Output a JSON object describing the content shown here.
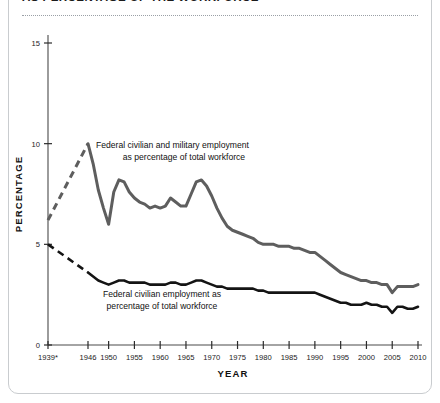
{
  "header": {
    "title": "AS PERCENTAGE OF THE WORKFORCE",
    "divider": "dotted-rule"
  },
  "colors": {
    "federal_total": "#5e5e5e",
    "federal_civilian": "#141414",
    "axis": "#4a4a4a",
    "text": "#111111",
    "card_border": "#c9cccf",
    "background": "#ffffff"
  },
  "annotations": {
    "total": {
      "line1": "Federal civilian and military employment",
      "line2": "as percentage of total workforce"
    },
    "civilian": {
      "line1": "Federal civilian employment as",
      "line2": "percentage of total workforce"
    }
  },
  "chart_data": {
    "type": "line",
    "title": "AS PERCENTAGE OF THE WORKFORCE",
    "xlabel": "YEAR",
    "ylabel": "PERCENTAGE",
    "xlim": [
      1939,
      2011
    ],
    "ylim": [
      0,
      15
    ],
    "yticks": [
      0,
      5,
      10,
      15
    ],
    "ytick_labels": [
      "0",
      "5",
      "10",
      "15"
    ],
    "xticks": [
      1939,
      1946,
      1950,
      1955,
      1960,
      1965,
      1970,
      1975,
      1980,
      1985,
      1990,
      1995,
      2000,
      2005,
      2010
    ],
    "xtick_labels": [
      "1939*",
      "1946",
      "1950",
      "1955",
      "1960",
      "1965",
      "1970",
      "1975",
      "1980",
      "1985",
      "1990",
      "1995",
      "2000",
      "2005",
      "2010"
    ],
    "grid": false,
    "legend": "annotations-inline",
    "footnote_marker": "*",
    "series": [
      {
        "name": "Federal civilian and military employment as percentage of total workforce",
        "color": "#5e5e5e",
        "dashed_segment": {
          "x": [
            1939,
            1946
          ],
          "values": [
            6.2,
            10.0
          ]
        },
        "x": [
          1946,
          1947,
          1948,
          1949,
          1950,
          1951,
          1952,
          1953,
          1954,
          1955,
          1956,
          1957,
          1958,
          1959,
          1960,
          1961,
          1962,
          1963,
          1964,
          1965,
          1966,
          1967,
          1968,
          1969,
          1970,
          1971,
          1972,
          1973,
          1974,
          1975,
          1976,
          1977,
          1978,
          1979,
          1980,
          1981,
          1982,
          1983,
          1984,
          1985,
          1986,
          1987,
          1988,
          1989,
          1990,
          1991,
          1992,
          1993,
          1994,
          1995,
          1996,
          1997,
          1998,
          1999,
          2000,
          2001,
          2002,
          2003,
          2004,
          2005,
          2006,
          2007,
          2008,
          2009,
          2010
        ],
        "values": [
          10.0,
          9.0,
          7.7,
          6.8,
          6.0,
          7.6,
          8.2,
          8.1,
          7.6,
          7.3,
          7.1,
          7.0,
          6.8,
          6.9,
          6.8,
          6.9,
          7.3,
          7.1,
          6.9,
          6.9,
          7.5,
          8.1,
          8.2,
          7.9,
          7.4,
          6.8,
          6.3,
          5.9,
          5.7,
          5.6,
          5.5,
          5.4,
          5.3,
          5.1,
          5.0,
          5.0,
          5.0,
          4.9,
          4.9,
          4.9,
          4.8,
          4.8,
          4.7,
          4.6,
          4.6,
          4.4,
          4.2,
          4.0,
          3.8,
          3.6,
          3.5,
          3.4,
          3.3,
          3.2,
          3.2,
          3.1,
          3.1,
          3.0,
          3.0,
          2.6,
          2.9,
          2.9,
          2.9,
          2.9,
          3.0
        ],
        "notes": "WWII demobilization drop to 1950; Korean War rise; Vietnam peak 1968; long decline; dip 2005"
      },
      {
        "name": "Federal civilian employment as percentage of total workforce",
        "color": "#141414",
        "dashed_segment": {
          "x": [
            1939,
            1946
          ],
          "values": [
            5.0,
            3.6
          ]
        },
        "x": [
          1946,
          1947,
          1948,
          1949,
          1950,
          1951,
          1952,
          1953,
          1954,
          1955,
          1956,
          1957,
          1958,
          1959,
          1960,
          1961,
          1962,
          1963,
          1964,
          1965,
          1966,
          1967,
          1968,
          1969,
          1970,
          1971,
          1972,
          1973,
          1974,
          1975,
          1976,
          1977,
          1978,
          1979,
          1980,
          1981,
          1982,
          1983,
          1984,
          1985,
          1986,
          1987,
          1988,
          1989,
          1990,
          1991,
          1992,
          1993,
          1994,
          1995,
          1996,
          1997,
          1998,
          1999,
          2000,
          2001,
          2002,
          2003,
          2004,
          2005,
          2006,
          2007,
          2008,
          2009,
          2010
        ],
        "values": [
          3.6,
          3.4,
          3.2,
          3.1,
          3.0,
          3.1,
          3.2,
          3.2,
          3.1,
          3.1,
          3.1,
          3.1,
          3.0,
          3.0,
          3.0,
          3.0,
          3.1,
          3.1,
          3.0,
          3.0,
          3.1,
          3.2,
          3.2,
          3.1,
          3.0,
          2.9,
          2.9,
          2.8,
          2.8,
          2.8,
          2.8,
          2.8,
          2.8,
          2.7,
          2.7,
          2.6,
          2.6,
          2.6,
          2.6,
          2.6,
          2.6,
          2.6,
          2.6,
          2.6,
          2.6,
          2.5,
          2.4,
          2.3,
          2.2,
          2.1,
          2.1,
          2.0,
          2.0,
          2.0,
          2.1,
          2.0,
          2.0,
          1.9,
          1.9,
          1.6,
          1.9,
          1.9,
          1.8,
          1.8,
          1.9
        ],
        "notes": "flat near 3% through 1970s, gradual decline, dip 2005"
      }
    ]
  }
}
